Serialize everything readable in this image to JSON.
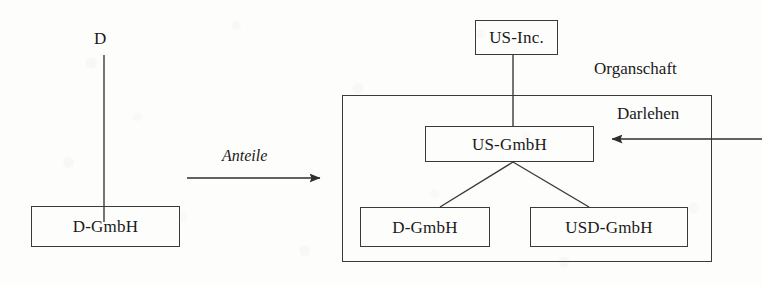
{
  "diagram": {
    "language": "de",
    "stroke_color": "#3a3a38",
    "text_color": "#1a1a1a",
    "background_color": "#fdfdfc"
  },
  "left_structure": {
    "owner_label": "D",
    "company": {
      "label": "D-GmbH"
    }
  },
  "transition": {
    "arrow_label": "Anteile",
    "direction": "right"
  },
  "right_structure": {
    "parent": {
      "label": "US-Inc."
    },
    "group_label": "Organschaft",
    "holding": {
      "label": "US-GmbH"
    },
    "subsidiaries": [
      {
        "label": "D-GmbH"
      },
      {
        "label": "USD-GmbH"
      }
    ],
    "incoming_arrow": {
      "label": "Darlehen",
      "direction": "left"
    }
  }
}
